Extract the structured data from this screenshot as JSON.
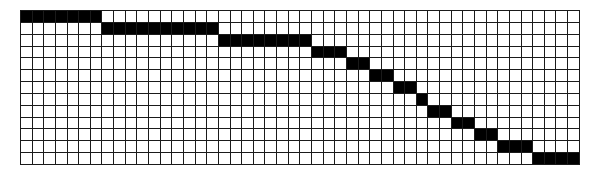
{
  "diagram": {
    "type": "staircase-grid",
    "rows": 13,
    "cols": 48,
    "cell_width": 11.65,
    "cell_height": 11.85,
    "colors": {
      "filled": "#000000",
      "empty": "#ffffff",
      "line": "#1a1a1a"
    },
    "filled_runs": [
      {
        "row": 0,
        "start_col": 0,
        "length": 7
      },
      {
        "row": 1,
        "start_col": 7,
        "length": 10
      },
      {
        "row": 2,
        "start_col": 17,
        "length": 8
      },
      {
        "row": 3,
        "start_col": 25,
        "length": 3
      },
      {
        "row": 4,
        "start_col": 28,
        "length": 2
      },
      {
        "row": 5,
        "start_col": 30,
        "length": 2
      },
      {
        "row": 6,
        "start_col": 32,
        "length": 2
      },
      {
        "row": 7,
        "start_col": 34,
        "length": 1
      },
      {
        "row": 8,
        "start_col": 35,
        "length": 2
      },
      {
        "row": 9,
        "start_col": 37,
        "length": 2
      },
      {
        "row": 10,
        "start_col": 39,
        "length": 2
      },
      {
        "row": 11,
        "start_col": 41,
        "length": 3
      },
      {
        "row": 12,
        "start_col": 44,
        "length": 4
      }
    ]
  }
}
